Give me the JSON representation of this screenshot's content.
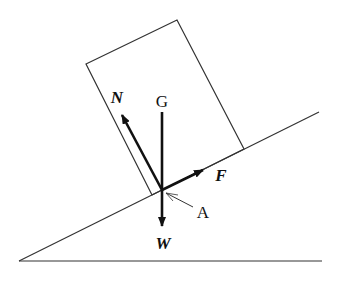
{
  "diagram": {
    "type": "free-body diagram of a block on an inclined plane",
    "labels": {
      "normal_force": "N",
      "center_of_gravity": "G",
      "friction_force": "F",
      "weight": "W",
      "contact_point": "A"
    },
    "colors": {
      "stroke": "#222222",
      "background": "#ffffff"
    }
  }
}
